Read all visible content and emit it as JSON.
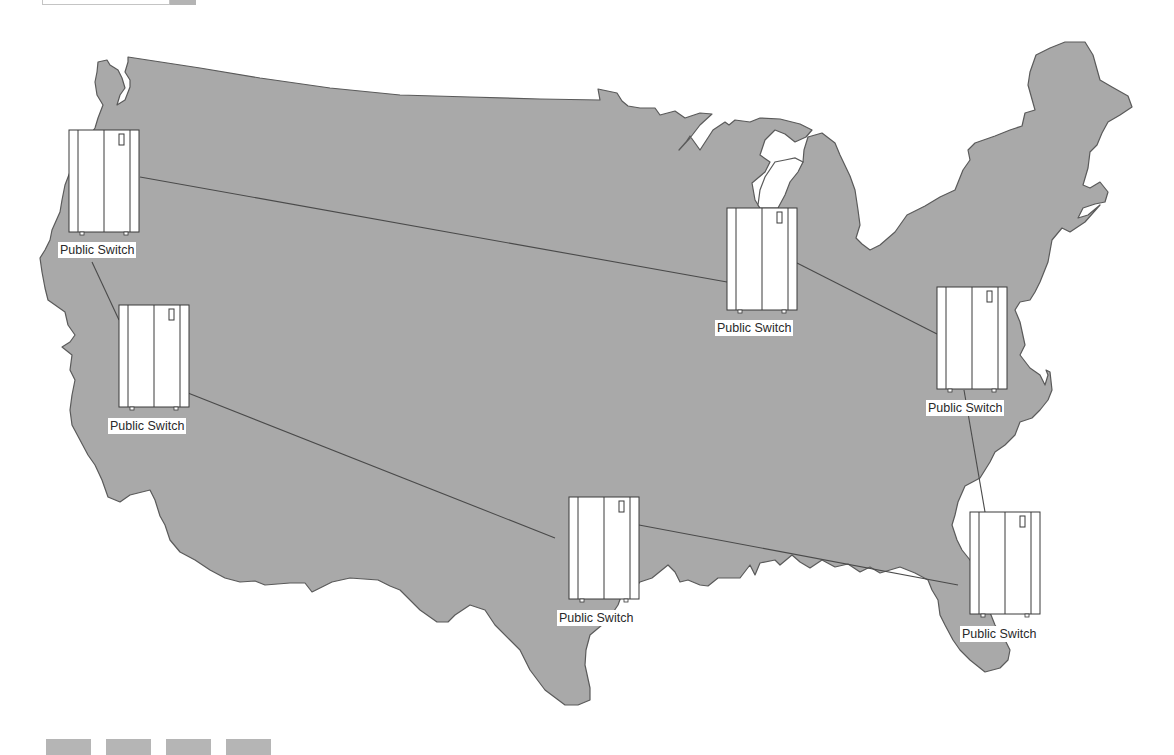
{
  "toolbar": {
    "search_field_value": "",
    "search_button_label": ""
  },
  "map": {
    "region": "Contiguous United States",
    "fill_color": "#a9a9a9",
    "outline_color": "#5a5a5a",
    "link_color": "#4a4a4a"
  },
  "nodes": [
    {
      "id": "sw-northwest",
      "label": "Public Switch",
      "x": 69,
      "y": 130,
      "label_x": 58,
      "label_y": 242
    },
    {
      "id": "sw-california",
      "label": "Public Switch",
      "x": 119,
      "y": 305,
      "label_x": 108,
      "label_y": 418
    },
    {
      "id": "sw-midwest",
      "label": "Public Switch",
      "x": 727,
      "y": 208,
      "label_x": 715,
      "label_y": 320
    },
    {
      "id": "sw-virginia",
      "label": "Public Switch",
      "x": 937,
      "y": 287,
      "label_x": 926,
      "label_y": 400
    },
    {
      "id": "sw-texas",
      "label": "Public Switch",
      "x": 569,
      "y": 497,
      "label_x": 557,
      "label_y": 610
    },
    {
      "id": "sw-florida",
      "label": "Public Switch",
      "x": 970,
      "y": 512,
      "label_x": 960,
      "label_y": 626
    }
  ],
  "links": [
    {
      "from": "sw-northwest",
      "to": "sw-midwest"
    },
    {
      "from": "sw-northwest",
      "to": "sw-california"
    },
    {
      "from": "sw-california",
      "to": "sw-texas"
    },
    {
      "from": "sw-texas",
      "to": "sw-florida"
    },
    {
      "from": "sw-midwest",
      "to": "sw-virginia"
    },
    {
      "from": "sw-virginia",
      "to": "sw-florida"
    }
  ],
  "bottom_toolbar": {
    "buttons": [
      "",
      "",
      "",
      ""
    ]
  }
}
